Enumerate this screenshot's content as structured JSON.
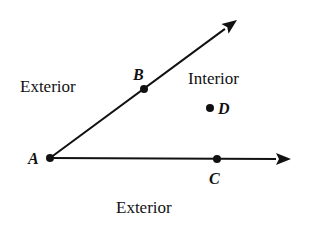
{
  "diagram": {
    "type": "angle-interior-exterior",
    "colors": {
      "ink": "#111111",
      "background": "#ffffff"
    },
    "vertex": {
      "label": "A",
      "x": 50,
      "y": 158
    },
    "rays": [
      {
        "name": "ray-AB",
        "from": "A",
        "through": "B",
        "tip": [
          237,
          20
        ]
      },
      {
        "name": "ray-AC",
        "from": "A",
        "through": "C",
        "tip": [
          291,
          159
        ]
      }
    ],
    "points": [
      {
        "label": "A",
        "x": 50,
        "y": 158,
        "label_x": 28,
        "label_y": 164
      },
      {
        "label": "B",
        "x": 144,
        "y": 89,
        "label_x": 133,
        "label_y": 80
      },
      {
        "label": "C",
        "x": 217,
        "y": 159,
        "label_x": 209,
        "label_y": 184
      },
      {
        "label": "D",
        "x": 210,
        "y": 108,
        "label_x": 218,
        "label_y": 114
      }
    ],
    "regions": [
      {
        "label": "Exterior",
        "x": 20,
        "y": 92
      },
      {
        "label": "Interior",
        "x": 188,
        "y": 84
      },
      {
        "label": "Exterior",
        "x": 116,
        "y": 213
      }
    ]
  }
}
